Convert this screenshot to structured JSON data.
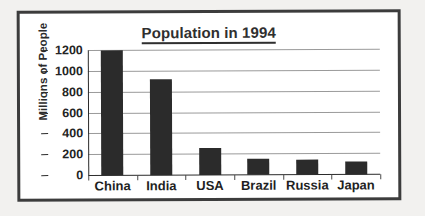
{
  "chart_data": {
    "type": "bar",
    "title": "Population in 1994",
    "xlabel": "",
    "ylabel": "Millions of People",
    "categories": [
      "China",
      "India",
      "USA",
      "Brazil",
      "Russia",
      "Japan"
    ],
    "values": [
      1200,
      920,
      260,
      155,
      145,
      125
    ],
    "series": [
      {
        "name": "Population",
        "values": [
          1200,
          920,
          260,
          155,
          145,
          125
        ]
      }
    ],
    "ylim": [
      0,
      1200
    ],
    "ytick_labels": [
      "1200",
      "1000",
      "800",
      "600",
      "400",
      "200",
      "0"
    ],
    "ytick_values": [
      1200,
      1000,
      800,
      600,
      400,
      200,
      0
    ],
    "grid": "horizontal",
    "legend": "none",
    "bar_color": "#2b2b2b",
    "gridline_color": "#9a9a9a",
    "axis_color": "#2b2b2b",
    "title_color": "#2f2f2f",
    "plot_background": "#ffffff",
    "page_background": "#f2f1ef",
    "frame_color": "#3c3c3c"
  }
}
